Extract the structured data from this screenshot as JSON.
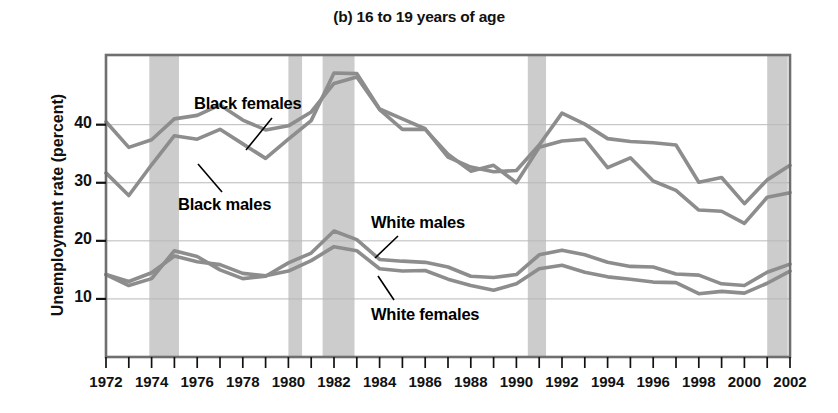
{
  "chart_data": {
    "type": "line",
    "title": "(b) 16 to 19 years of age",
    "xlabel": "",
    "ylabel": "Unemployment rate (percent)",
    "xlim": [
      1972,
      2002
    ],
    "ylim": [
      0,
      52
    ],
    "yticks": [
      10,
      20,
      30,
      40
    ],
    "ytick_labels": [
      "10",
      "20",
      "30",
      "40"
    ],
    "grid": true,
    "legend_position": "inline-annotations",
    "x": [
      1972,
      1973,
      1974,
      1975,
      1976,
      1977,
      1978,
      1979,
      1980,
      1981,
      1982,
      1983,
      1984,
      1985,
      1986,
      1987,
      1988,
      1989,
      1990,
      1991,
      1992,
      1993,
      1994,
      1995,
      1996,
      1997,
      1998,
      1999,
      2000,
      2001,
      2002
    ],
    "xtick_labels": [
      "1972",
      "1974",
      "1976",
      "1978",
      "1980",
      "1982",
      "1984",
      "1986",
      "1988",
      "1990",
      "1992",
      "1994",
      "1996",
      "1998",
      "2000",
      "2002"
    ],
    "series": [
      {
        "name": "Black females",
        "color": "#8d8d8d",
        "values": [
          40.5,
          36.1,
          37.4,
          41.0,
          41.6,
          43.4,
          40.8,
          39.1,
          39.8,
          42.2,
          47.1,
          48.2,
          42.6,
          39.2,
          39.2,
          34.9,
          32.0,
          33.0,
          30.0,
          36.1,
          37.2,
          37.5,
          32.6,
          34.3,
          30.3,
          28.7,
          25.3,
          25.1,
          23.0,
          27.5,
          28.3
        ]
      },
      {
        "name": "Black males",
        "color": "#8d8d8d",
        "values": [
          31.7,
          27.8,
          33.1,
          38.1,
          37.5,
          39.2,
          36.7,
          34.2,
          37.5,
          40.7,
          48.9,
          48.8,
          42.7,
          41.0,
          39.3,
          34.4,
          32.7,
          31.9,
          32.1,
          36.5,
          42.0,
          40.1,
          37.6,
          37.1,
          36.9,
          36.5,
          30.1,
          30.9,
          26.4,
          30.5,
          33.0
        ]
      },
      {
        "name": "White males",
        "color": "#8d8d8d",
        "values": [
          14.2,
          12.3,
          13.5,
          18.3,
          17.3,
          15.0,
          13.5,
          13.9,
          16.2,
          17.9,
          21.7,
          20.2,
          16.8,
          16.5,
          16.3,
          15.5,
          13.9,
          13.7,
          14.2,
          17.6,
          18.4,
          17.6,
          16.3,
          15.6,
          15.5,
          14.3,
          14.1,
          12.6,
          12.3,
          14.6,
          16.0
        ]
      },
      {
        "name": "White females",
        "color": "#8d8d8d",
        "values": [
          14.2,
          13.0,
          14.5,
          17.4,
          16.4,
          15.9,
          14.4,
          14.0,
          14.8,
          16.6,
          19.0,
          18.3,
          15.2,
          14.8,
          14.9,
          13.4,
          12.3,
          11.5,
          12.6,
          15.2,
          15.8,
          14.6,
          13.8,
          13.4,
          12.9,
          12.8,
          10.9,
          11.3,
          11.0,
          12.7,
          14.8
        ]
      }
    ],
    "annotations": [
      {
        "text": "Black females",
        "for_series": "Black females"
      },
      {
        "text": "Black males",
        "for_series": "Black males"
      },
      {
        "text": "White males",
        "for_series": "White males"
      },
      {
        "text": "White females",
        "for_series": "White females"
      }
    ],
    "recession_bands": [
      {
        "start": 1973.9,
        "end": 1975.2
      },
      {
        "start": 1980.0,
        "end": 1980.6
      },
      {
        "start": 1981.5,
        "end": 1982.9
      },
      {
        "start": 1990.5,
        "end": 1991.3
      },
      {
        "start": 2001.0,
        "end": 2001.9
      }
    ],
    "colors": {
      "axis": "#6f6f6f",
      "grid": "#b9b9b9",
      "band": "#cccccc",
      "line": "#8d8d8d",
      "text": "#111111",
      "background": "#ffffff"
    }
  }
}
